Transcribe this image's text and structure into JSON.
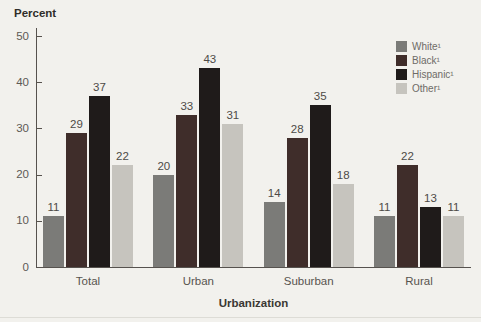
{
  "chart_data": {
    "type": "bar",
    "title": "",
    "categories": [
      "Total",
      "Urban",
      "Suburban",
      "Rural"
    ],
    "series": [
      {
        "name": "White¹",
        "color": "#7b7b78",
        "values": [
          11,
          20,
          14,
          11
        ]
      },
      {
        "name": "Black¹",
        "color": "#3f2d2a",
        "values": [
          29,
          33,
          28,
          22
        ]
      },
      {
        "name": "Hispanic¹",
        "color": "#1f1b1a",
        "values": [
          37,
          43,
          35,
          13
        ]
      },
      {
        "name": "Other¹",
        "color": "#c6c4be",
        "values": [
          22,
          31,
          18,
          11
        ]
      }
    ],
    "xlabel": "Urbanization",
    "ylabel": "Percent",
    "ylim": [
      0,
      50
    ],
    "yticks": [
      0,
      10,
      20,
      30,
      40,
      50
    ],
    "grid": false,
    "legend_position": "top-right",
    "value_labels": true
  }
}
